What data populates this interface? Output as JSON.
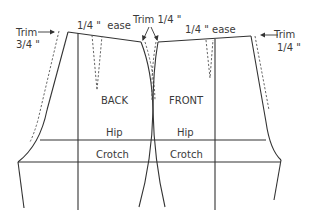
{
  "diagram": {
    "labels": {
      "trim_left_line1": "Trim",
      "trim_left_line2": "3/4 \"",
      "ease_back": "1/4 \"  ease",
      "trim_center": "Trim 1/4 \"",
      "ease_front": "1/4 \" ease",
      "trim_right_line1": "Trim",
      "trim_right_line2": "1/4 \"",
      "back": "BACK",
      "front": "FRONT",
      "hip_back": "Hip",
      "hip_front": "Hip",
      "crotch_back": "Crotch",
      "crotch_front": "Crotch"
    },
    "pieces": [
      {
        "name": "BACK",
        "side": "left"
      },
      {
        "name": "FRONT",
        "side": "right"
      }
    ],
    "reference_lines": [
      "Hip",
      "Crotch"
    ],
    "colors": {
      "line": "#333333",
      "text": "#3a3a3a",
      "background": "#ffffff"
    }
  }
}
